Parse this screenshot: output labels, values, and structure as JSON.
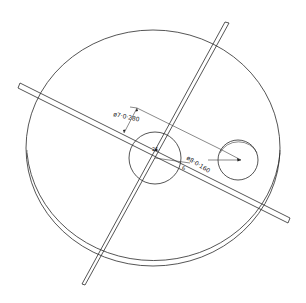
{
  "figure": {
    "colors": {
      "line": "#2a2a2a",
      "background": "#ffffff"
    }
  },
  "annotations": {
    "dim_large_hole": "ø7·0·280",
    "dim_small_hole": "ø8·0·160",
    "label_center": "25",
    "label_edge": "6"
  },
  "parts": [
    {
      "name": "disc",
      "label": ""
    },
    {
      "name": "center-hole",
      "label": ""
    },
    {
      "name": "offset-hole",
      "label": ""
    },
    {
      "name": "section-plane-a",
      "label": ""
    },
    {
      "name": "section-plane-b",
      "label": ""
    }
  ]
}
